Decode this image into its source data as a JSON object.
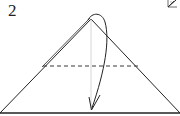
{
  "step": {
    "number": "2"
  },
  "diagram": {
    "type": "origami-fold-step",
    "shapes": {
      "triangle": {
        "apex": [
          91,
          19
        ],
        "base_left": [
          0,
          113
        ],
        "base_right": [
          180,
          113
        ]
      },
      "dashed_fold_line": {
        "y": 66,
        "x1": 43,
        "x2": 138
      },
      "center_crease": {
        "x": 91,
        "y1": 19,
        "y2": 111
      },
      "fold_arrow": {
        "from": [
          91,
          19
        ],
        "to": [
          91,
          111
        ]
      }
    },
    "colors": {
      "stroke": "#222222",
      "crease": "#cccccc",
      "background": "#ffffff"
    }
  }
}
